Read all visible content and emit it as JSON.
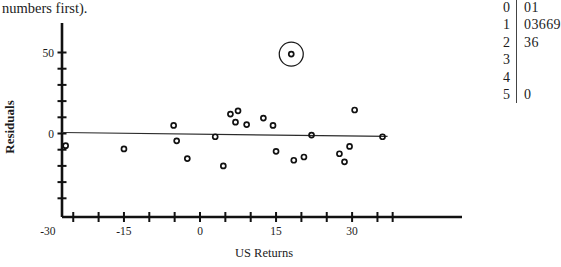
{
  "caption": {
    "text": "numbers first)."
  },
  "chart_data": {
    "type": "scatter",
    "title": "",
    "xlabel": "US Returns",
    "ylabel": "Residuals",
    "xlim": [
      -34,
      38
    ],
    "ylim": [
      -34,
      58
    ],
    "grid": false,
    "legend": null,
    "x_ticks_labeled": [
      -30,
      -15,
      0,
      15,
      30
    ],
    "x_tick_labels": [
      "-30",
      "-15",
      "0",
      "15",
      "30"
    ],
    "x_ticks_all": [
      -30,
      -25,
      -20,
      -15,
      -10,
      -5,
      0,
      5,
      10,
      15,
      20,
      25,
      30,
      35,
      38
    ],
    "y_ticks_labeled": [
      50,
      0
    ],
    "y_tick_labels": [
      "50",
      "0"
    ],
    "y_ticks_all": [
      50,
      40,
      30,
      20,
      10,
      0,
      -10,
      -20,
      -30,
      -40
    ],
    "reference_line": {
      "label": "fitted-zero-line",
      "x_start": -30,
      "y_start": 0.6,
      "x_end": 37,
      "y_end": -1.8
    },
    "points": [
      {
        "x": -26.5,
        "y": -7.5
      },
      {
        "x": -15.0,
        "y": -9.5
      },
      {
        "x": -5.2,
        "y": 5.0
      },
      {
        "x": -4.6,
        "y": -4.5
      },
      {
        "x": -2.5,
        "y": -15.5
      },
      {
        "x": 3.0,
        "y": -2.0
      },
      {
        "x": 4.6,
        "y": -20.0
      },
      {
        "x": 6.0,
        "y": 12.0
      },
      {
        "x": 7.0,
        "y": 7.0
      },
      {
        "x": 7.5,
        "y": 14.0
      },
      {
        "x": 9.2,
        "y": 5.5
      },
      {
        "x": 12.5,
        "y": 9.5
      },
      {
        "x": 14.4,
        "y": 5.0
      },
      {
        "x": 15.0,
        "y": -11.0
      },
      {
        "x": 18.5,
        "y": -16.5
      },
      {
        "x": 20.5,
        "y": -14.5
      },
      {
        "x": 22.0,
        "y": -1.0
      },
      {
        "x": 27.5,
        "y": -12.5
      },
      {
        "x": 28.5,
        "y": -17.5
      },
      {
        "x": 29.5,
        "y": -8.0
      },
      {
        "x": 30.5,
        "y": 14.5
      },
      {
        "x": 36.0,
        "y": -2.0
      }
    ],
    "highlighted_point": {
      "x": 18.0,
      "y": 49.0,
      "marker": "circled-outlier"
    },
    "annotations": [
      {
        "type": "circle",
        "target": "outlier",
        "x": 18.0,
        "y": 49.0,
        "radius_px": 12
      }
    ]
  },
  "stem_leaf": {
    "title": "",
    "rows": [
      {
        "stem": "0",
        "leaves": "01"
      },
      {
        "stem": "1",
        "leaves": "03669"
      },
      {
        "stem": "2",
        "leaves": "36"
      },
      {
        "stem": "3",
        "leaves": ""
      },
      {
        "stem": "4",
        "leaves": ""
      },
      {
        "stem": "5",
        "leaves": "0"
      }
    ]
  }
}
